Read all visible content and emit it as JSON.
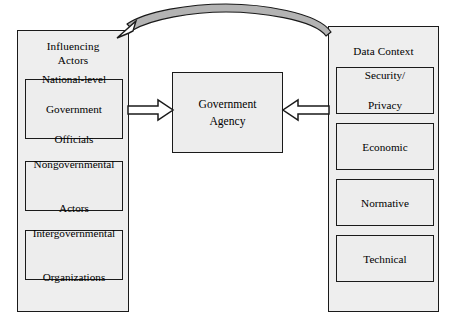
{
  "diagram": {
    "colors": {
      "panel_fill": "#eeeeee",
      "box_fill": "#ededed",
      "stroke": "#1a1a1a",
      "background": "#ffffff"
    },
    "center": {
      "label_line1": "Government",
      "label_line2": "Agency"
    },
    "left_panel": {
      "title_line1": "Influencing",
      "title_line2": "Actors",
      "items": [
        {
          "line1": "National-level",
          "line2": "Government",
          "line3": "Officials"
        },
        {
          "line1": "Nongovernmental",
          "line2": "Actors",
          "line3": ""
        },
        {
          "line1": "Intergovernmental",
          "line2": "Organizations",
          "line3": ""
        }
      ]
    },
    "right_panel": {
      "title": "Data Context",
      "items": [
        {
          "line1": "Security/",
          "line2": "Privacy"
        },
        {
          "line1": "Economic",
          "line2": ""
        },
        {
          "line1": "Normative",
          "line2": ""
        },
        {
          "line1": "Technical",
          "line2": ""
        }
      ]
    },
    "connectors": [
      {
        "name": "influencing-actors-to-government-agency",
        "style": "hollow-block-arrow",
        "direction": "right"
      },
      {
        "name": "data-context-to-government-agency",
        "style": "hollow-block-arrow",
        "direction": "left"
      },
      {
        "name": "data-context-to-influencing-actors",
        "style": "curved-tapered-arrow",
        "direction": "left"
      }
    ]
  }
}
